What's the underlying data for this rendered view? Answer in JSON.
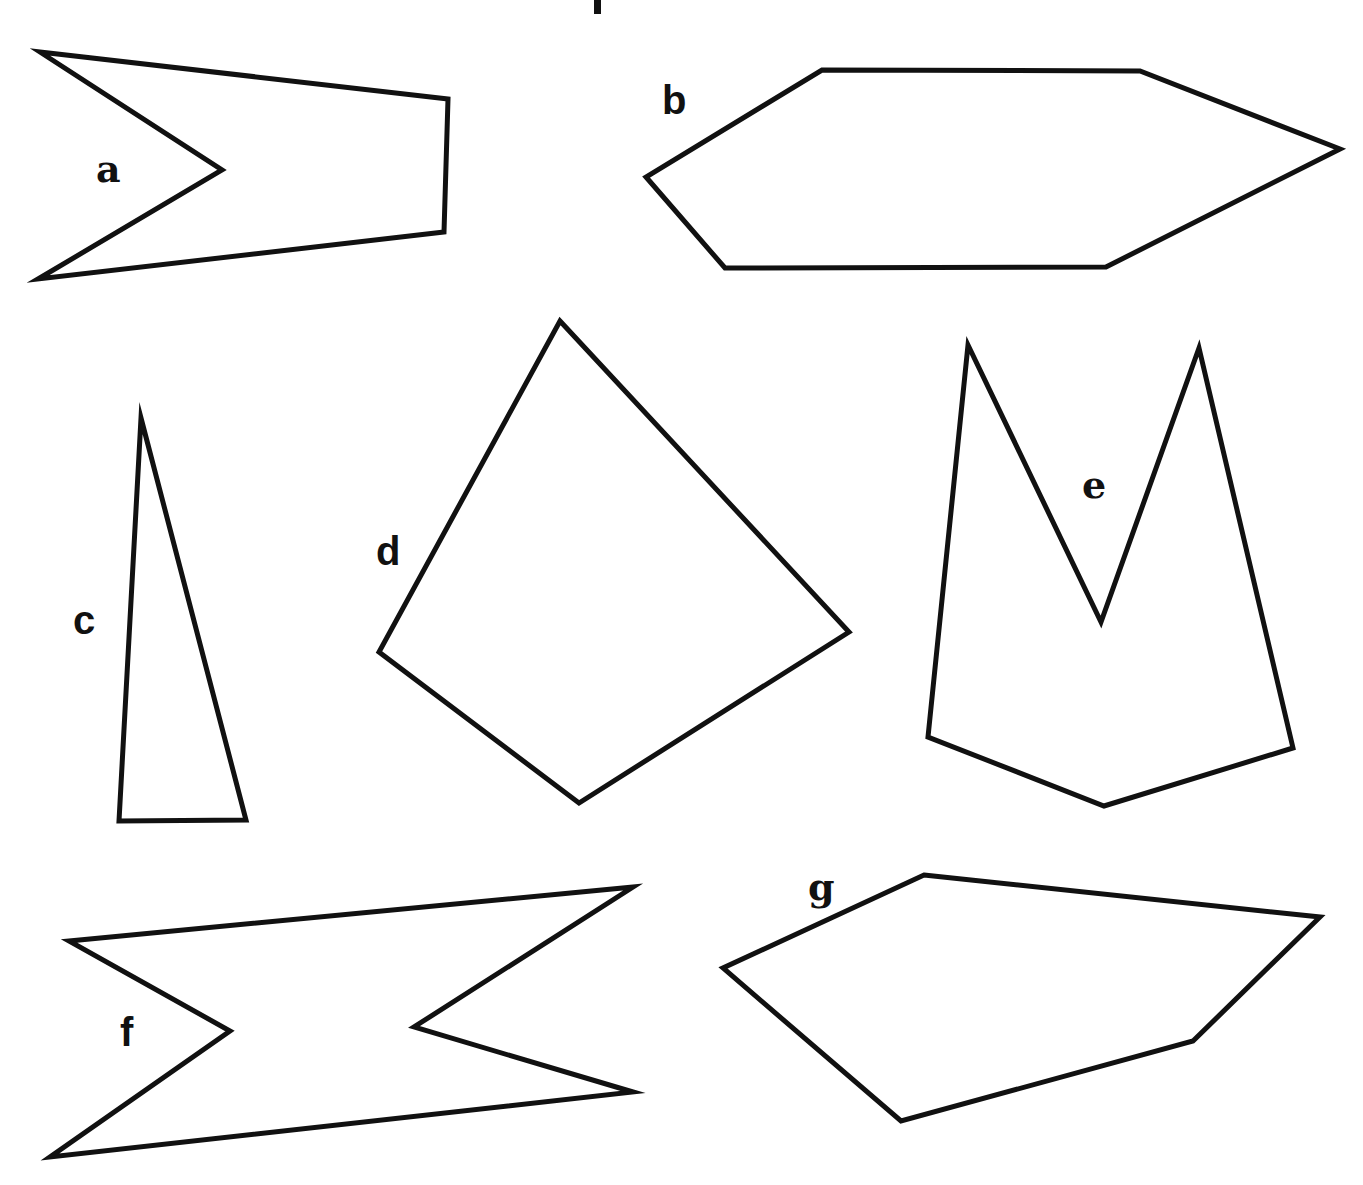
{
  "title_fragment": {
    "visible": true,
    "note": "descender of a cut-off title glyph at top"
  },
  "shapes": [
    {
      "id": "a",
      "label": "a",
      "points": "40,52 448,99 444,232 38,279 222,170",
      "label_pos": {
        "x": 96,
        "y": 150
      },
      "label_style": "serif"
    },
    {
      "id": "b",
      "label": "b",
      "points": "822,70 1140,71 1340,149 1106,267 725,268 646,177",
      "label_pos": {
        "x": 662,
        "y": 82
      },
      "label_style": "sans"
    },
    {
      "id": "c",
      "label": "c",
      "points": "141,418 246,820 119,821",
      "label_pos": {
        "x": 73,
        "y": 600
      },
      "label_style": "sans"
    },
    {
      "id": "d",
      "label": "d",
      "points": "560,321 849,632 579,803 379,652",
      "label_pos": {
        "x": 376,
        "y": 533
      },
      "label_style": "sans"
    },
    {
      "id": "e",
      "label": "e",
      "points": "968,345 1101,622 1199,348 1293,748 1104,806 928,737",
      "label_pos": {
        "x": 1082,
        "y": 466
      },
      "label_style": "serif"
    },
    {
      "id": "f",
      "label": "f",
      "points": "69,941 633,887 414,1027 633,1092 50,1157 230,1031",
      "label_pos": {
        "x": 120,
        "y": 1013
      },
      "label_style": "sans"
    },
    {
      "id": "g",
      "label": "g",
      "points": "924,875 1320,917 1193,1041 901,1121 723,968",
      "label_pos": {
        "x": 808,
        "y": 870
      },
      "label_style": "serif"
    }
  ],
  "stroke_color": "#111111",
  "background_color": "#ffffff"
}
